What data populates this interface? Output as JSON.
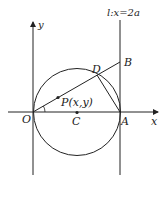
{
  "diagram": {
    "labels": {
      "y_axis": "y",
      "x_axis": "x",
      "origin": "O",
      "center": "C",
      "point_a": "A",
      "point_b": "B",
      "point_d": "D",
      "point_p": "P(x,y)",
      "line_l": "l:x=2a"
    },
    "colors": {
      "stroke": "#222222",
      "background": "#ffffff"
    }
  }
}
